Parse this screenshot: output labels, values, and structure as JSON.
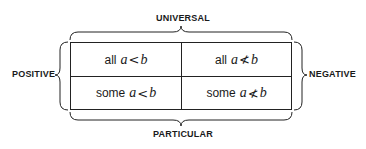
{
  "labels": {
    "top": "UNIVERSAL",
    "bottom": "PARTICULAR",
    "left": "POSITIVE",
    "right": "NEGATIVE"
  },
  "cells": [
    {
      "quantifier": "all",
      "var1": "a",
      "relation": "<",
      "var2": "b"
    },
    {
      "quantifier": "all",
      "var1": "a",
      "relation": "≮",
      "var2": "b"
    },
    {
      "quantifier": "some",
      "var1": "a",
      "relation": "<",
      "var2": "b"
    },
    {
      "quantifier": "some",
      "var1": "a",
      "relation": "≮",
      "var2": "b"
    }
  ]
}
